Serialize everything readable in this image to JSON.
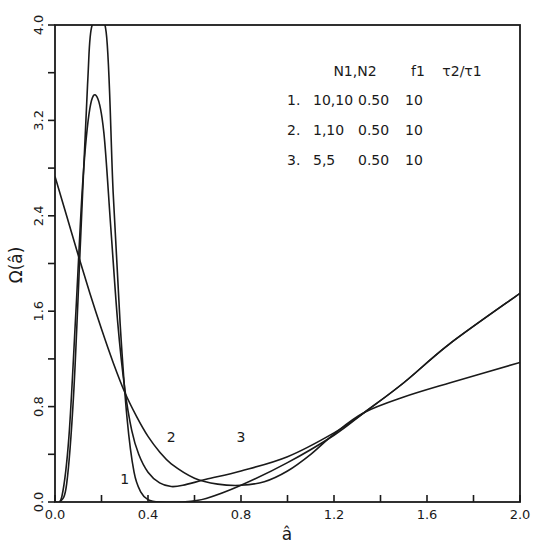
{
  "chart_data": {
    "type": "line",
    "title": "",
    "xlabel": "â",
    "ylabel": "Ω(â)",
    "xlim": [
      0.0,
      2.0
    ],
    "ylim": [
      0.0,
      4.0
    ],
    "grid": false,
    "x_ticks": [
      "0.0",
      "0.4",
      "0.8",
      "1.2",
      "1.6",
      "2.0"
    ],
    "x_minor_ticks": [
      0.2,
      0.6,
      1.0,
      1.4,
      1.8
    ],
    "y_ticks": [
      "0.0",
      "0.8",
      "1.6",
      "2.4",
      "3.2",
      "4.0"
    ],
    "y_minor_ticks": [
      0.4,
      1.2,
      2.0,
      2.8,
      3.6
    ],
    "legend": {
      "position": "upper right (inside)",
      "headers": [
        "N1,N2",
        "f1",
        "τ2/τ1"
      ],
      "rows": [
        {
          "id": "1.",
          "n1n2": "10,10",
          "f1": "0.50",
          "tau_ratio": "10"
        },
        {
          "id": "2.",
          "n1n2": "1,10",
          "f1": "0.50",
          "tau_ratio": "10"
        },
        {
          "id": "3.",
          "n1n2": "5,5",
          "f1": "0.50",
          "tau_ratio": "10"
        }
      ]
    },
    "annotations": [
      {
        "text": "1",
        "x": 0.3,
        "y": 0.15
      },
      {
        "text": "2",
        "x": 0.5,
        "y": 0.5
      },
      {
        "text": "3",
        "x": 0.8,
        "y": 0.5
      }
    ],
    "series": [
      {
        "name": "1",
        "label": "N1,N2 = 10,10; f1 = 0.50; τ2/τ1 = 10",
        "x": [
          0.0,
          0.02,
          0.05,
          0.08,
          0.11,
          0.14,
          0.16,
          0.22,
          0.25,
          0.28,
          0.31,
          0.34,
          0.37,
          0.4,
          0.45,
          0.55,
          0.65,
          0.8,
          1.0,
          1.2,
          1.33,
          1.5,
          1.7,
          2.0
        ],
        "y": [
          0.0,
          0.0,
          0.15,
          0.9,
          2.2,
          3.5,
          4.0,
          3.94,
          2.6,
          1.5,
          0.7,
          0.25,
          0.08,
          0.02,
          0.0,
          0.0,
          0.03,
          0.14,
          0.33,
          0.56,
          0.75,
          1.0,
          1.33,
          1.75
        ]
      },
      {
        "name": "2",
        "label": "N1,N2 = 1,10; f1 = 0.50; τ2/τ1 = 10",
        "x": [
          0.0,
          0.03,
          0.06,
          0.09,
          0.12,
          0.15,
          0.18,
          0.21,
          0.24,
          0.27,
          0.3,
          0.33,
          0.36,
          0.4,
          0.45,
          0.5,
          0.55,
          0.65,
          0.8,
          1.0,
          1.2,
          1.33,
          1.5,
          1.7,
          2.0
        ],
        "y": [
          0.0,
          0.05,
          0.55,
          1.6,
          2.7,
          3.3,
          3.4,
          3.1,
          2.3,
          1.5,
          0.95,
          0.6,
          0.4,
          0.25,
          0.16,
          0.13,
          0.14,
          0.19,
          0.26,
          0.38,
          0.58,
          0.75,
          1.0,
          1.33,
          1.75
        ]
      },
      {
        "name": "3",
        "label": "N1,N2 = 5,5; f1 = 0.50; τ2/τ1 = 10",
        "x": [
          0.0,
          0.05,
          0.1,
          0.15,
          0.2,
          0.25,
          0.3,
          0.35,
          0.4,
          0.45,
          0.5,
          0.6,
          0.7,
          0.8,
          0.9,
          1.0,
          1.1,
          1.2,
          1.33,
          1.5,
          1.7,
          2.0
        ],
        "y": [
          2.73,
          2.4,
          2.07,
          1.75,
          1.45,
          1.17,
          0.92,
          0.72,
          0.55,
          0.42,
          0.32,
          0.2,
          0.15,
          0.14,
          0.17,
          0.26,
          0.4,
          0.57,
          0.75,
          0.88,
          1.0,
          1.17
        ]
      }
    ]
  }
}
